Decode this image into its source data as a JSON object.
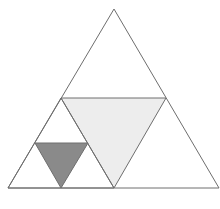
{
  "diagram": {
    "description": "Equilateral triangle subdivided Sierpinski-style with shaded inner triangles",
    "stroke_color": "#6e6e6e",
    "stroke_width": 1,
    "shapes": [
      {
        "name": "outer-triangle",
        "points": [
          [
            114,
            9
          ],
          [
            8,
            188
          ],
          [
            219,
            188
          ]
        ],
        "fill": "#ffffff"
      },
      {
        "name": "middle-inverted-triangle",
        "points": [
          [
            61,
            98
          ],
          [
            166,
            98
          ],
          [
            114,
            188
          ]
        ],
        "fill": "#ededed"
      },
      {
        "name": "lower-left-subtriangle",
        "points": [
          [
            61,
            98
          ],
          [
            8,
            188
          ],
          [
            114,
            188
          ]
        ],
        "fill": "none"
      },
      {
        "name": "small-shaded-inverted-triangle",
        "points": [
          [
            35,
            143
          ],
          [
            88,
            143
          ],
          [
            61,
            188
          ]
        ],
        "fill": "#8a8a8a"
      }
    ],
    "colors": {
      "background": "#ffffff",
      "light_shade": "#ededed",
      "dark_shade": "#8a8a8a",
      "line": "#6e6e6e"
    }
  }
}
